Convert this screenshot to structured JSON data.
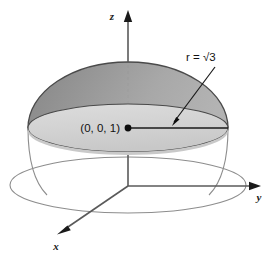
{
  "figure": {
    "axes": {
      "z_label": "z",
      "y_label": "y",
      "x_label": "x"
    },
    "annotations": {
      "point_label": "(0, 0, 1)",
      "radius_label": "r = √3"
    },
    "colors": {
      "stroke": "#4a4a4a",
      "dark_stroke": "#1a1a1a",
      "dome_outer_light": "#ececec",
      "dome_outer_mid": "#d8d8d8",
      "dome_inner_dark": "#8f8f8f",
      "disk_fill": "#cfcfcf",
      "rim_fill": "#d4d4d4",
      "dashed": "#9a9a9a",
      "background": "#ffffff"
    }
  }
}
